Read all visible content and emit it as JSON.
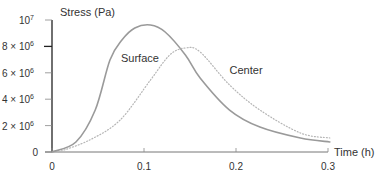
{
  "chart_data": {
    "type": "line",
    "title": "",
    "xlabel": "Time (h)",
    "ylabel": "Stress (Pa)",
    "xlim": [
      0,
      0.3
    ],
    "ylim": [
      0,
      10000000
    ],
    "grid": false,
    "legend": "inline labels",
    "x_ticks": [
      {
        "value": 0,
        "label": "0"
      },
      {
        "value": 0.1,
        "label": "0.1"
      },
      {
        "value": 0.2,
        "label": "0.2"
      },
      {
        "value": 0.3,
        "label": "0.3"
      }
    ],
    "y_ticks": [
      {
        "value": 0,
        "label": "0",
        "base": "0",
        "exp": ""
      },
      {
        "value": 2000000,
        "label": "2 × 10^6",
        "base": "2 × 10",
        "exp": "6"
      },
      {
        "value": 4000000,
        "label": "4 × 10^6",
        "base": "4 × 10",
        "exp": "6"
      },
      {
        "value": 6000000,
        "label": "6 × 10^6",
        "base": "6 × 10",
        "exp": "6"
      },
      {
        "value": 8000000,
        "label": "8 × 10^6",
        "base": "8 × 10",
        "exp": "6"
      },
      {
        "value": 10000000,
        "label": "10^7",
        "base": "10",
        "exp": "7"
      }
    ],
    "series": [
      {
        "name": "Surface",
        "style": "solid",
        "color": "#9a9a9a",
        "x": [
          0,
          0.026,
          0.047,
          0.063,
          0.076,
          0.09,
          0.107,
          0.123,
          0.145,
          0.161,
          0.193,
          0.226,
          0.27,
          0.302
        ],
        "y": [
          0,
          760000,
          3180000,
          6970000,
          8480000,
          9390000,
          9620000,
          9090000,
          7350000,
          5610000,
          3180000,
          1890000,
          1060000,
          760000
        ],
        "label_pos": {
          "x": 0.075,
          "y": 6800000
        }
      },
      {
        "name": "Center",
        "style": "dotted",
        "color": "#b5b5b5",
        "x": [
          0.007,
          0.041,
          0.074,
          0.107,
          0.128,
          0.145,
          0.161,
          0.193,
          0.226,
          0.27,
          0.302
        ],
        "y": [
          0,
          910000,
          2420000,
          5450000,
          7350000,
          7880000,
          7580000,
          5080000,
          3180000,
          1440000,
          1060000
        ],
        "label_pos": {
          "x": 0.193,
          "y": 5900000
        }
      }
    ]
  }
}
